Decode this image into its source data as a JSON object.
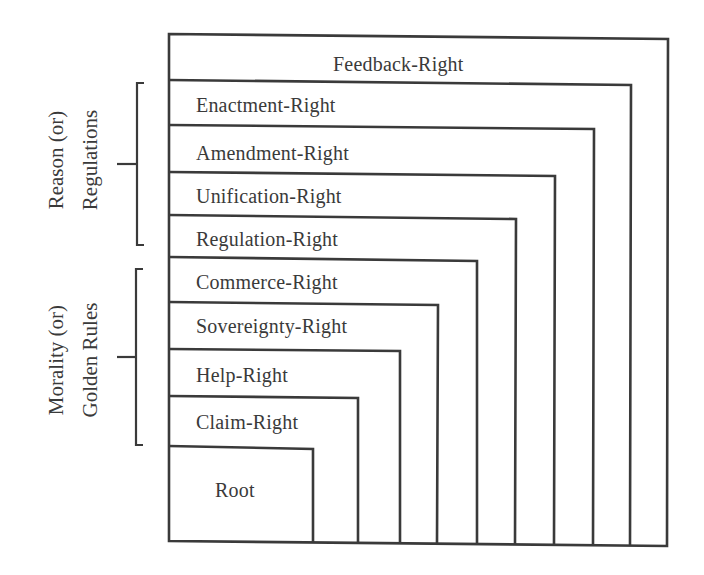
{
  "diagram": {
    "levels": [
      {
        "id": "feedback",
        "label": "Feedback-Right"
      },
      {
        "id": "enactment",
        "label": "Enactment-Right"
      },
      {
        "id": "amendment",
        "label": "Amendment-Right"
      },
      {
        "id": "unification",
        "label": "Unification-Right"
      },
      {
        "id": "regulation",
        "label": "Regulation-Right"
      },
      {
        "id": "commerce",
        "label": "Commerce-Right"
      },
      {
        "id": "sovereignty",
        "label": "Sovereignty-Right"
      },
      {
        "id": "help",
        "label": "Help-Right"
      },
      {
        "id": "claim",
        "label": "Claim-Right"
      },
      {
        "id": "root",
        "label": "Root"
      }
    ],
    "groups": [
      {
        "id": "reason",
        "line1": "Reason (or)",
        "line2": "Regulations",
        "covers": [
          "enactment",
          "amendment",
          "unification",
          "regulation"
        ]
      },
      {
        "id": "morality",
        "line1": "Morality (or)",
        "line2": "Golden Rules",
        "covers": [
          "commerce",
          "sovereignty",
          "help",
          "claim"
        ]
      }
    ],
    "stroke_color": "#3a3a3a",
    "background_color": "#ffffff"
  }
}
